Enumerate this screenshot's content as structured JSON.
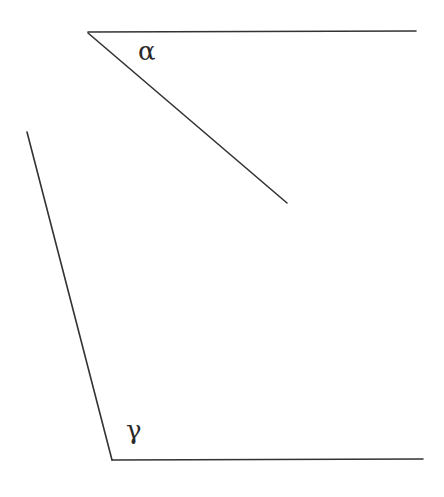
{
  "diagram": {
    "type": "geometry-angles",
    "background": "#ffffff",
    "stroke_color": "#333333",
    "stroke_width": 1.6,
    "segments": [
      {
        "name": "alpha-top-ray",
        "x1": 88,
        "y1": 32,
        "x2": 416,
        "y2": 31
      },
      {
        "name": "alpha-diagonal-ray",
        "x1": 88,
        "y1": 33,
        "x2": 287,
        "y2": 203
      },
      {
        "name": "gamma-left-ray",
        "x1": 27,
        "y1": 132,
        "x2": 112,
        "y2": 460
      },
      {
        "name": "gamma-bottom-ray",
        "x1": 112,
        "y1": 460,
        "x2": 423,
        "y2": 459
      }
    ],
    "labels": {
      "alpha": {
        "text": "α",
        "x": 138,
        "y": 38
      },
      "gamma": {
        "text": "γ",
        "x": 126,
        "y": 417
      }
    }
  }
}
